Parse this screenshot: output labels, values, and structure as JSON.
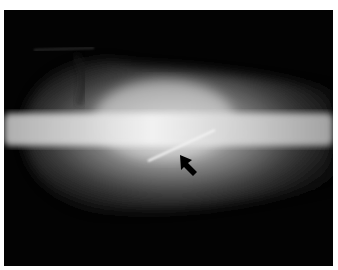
{
  "image": {
    "type": "radiograph",
    "description": "Lateral X-ray of a small animal body showing the spine horizontally with a linear radiopaque foreign body (needle-like) below the spine, indicated by a black arrow",
    "background_color": "#030303",
    "border_color": "#ffffff",
    "annotations": [
      {
        "type": "arrow",
        "color": "#000000",
        "direction": "up-left",
        "points_to": "linear foreign body"
      }
    ]
  }
}
